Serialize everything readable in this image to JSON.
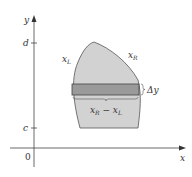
{
  "diagram": {
    "axes": {
      "x_label": "x",
      "y_label": "y",
      "origin_label": "0"
    },
    "ticks": {
      "d_label": "d",
      "c_label": "c"
    },
    "curves": {
      "left_label": "x_L",
      "right_label": "x_R"
    },
    "strip": {
      "height_label": "Δy",
      "width_label": "x_R − x_L"
    },
    "colors": {
      "region_fill": "#d2d2d2",
      "strip_fill": "#9a9a9a",
      "outline": "#555555",
      "axis": "#444444"
    }
  }
}
